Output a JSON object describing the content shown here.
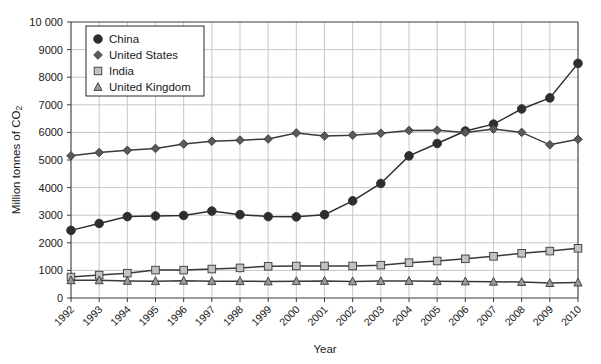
{
  "chart_data": {
    "type": "line",
    "title": "",
    "xlabel": "Year",
    "ylabel": "Million tonnes of CO₂",
    "ylim": [
      0,
      10000
    ],
    "ytick_step": 1000,
    "ytick_labels": [
      "0",
      "1000",
      "2000",
      "3000",
      "4000",
      "5000",
      "6000",
      "7000",
      "8000",
      "9000",
      "10 000"
    ],
    "grid": true,
    "legend_position": "top-left",
    "x": [
      1992,
      1993,
      1994,
      1995,
      1996,
      1997,
      1998,
      1999,
      2000,
      2001,
      2002,
      2003,
      2004,
      2005,
      2006,
      2007,
      2008,
      2009,
      2010
    ],
    "categories": [
      "1992",
      "1993",
      "1994",
      "1995",
      "1996",
      "1997",
      "1998",
      "1999",
      "2000",
      "2001",
      "2002",
      "2003",
      "2004",
      "2005",
      "2006",
      "2007",
      "2008",
      "2009",
      "2010"
    ],
    "series": [
      {
        "name": "China",
        "marker": "circle",
        "color": "#2e2e2e",
        "marker_fill": "#2e2e2e",
        "values": [
          2450,
          2700,
          2950,
          2970,
          2990,
          3150,
          3020,
          2950,
          2940,
          3020,
          3520,
          4150,
          5150,
          5600,
          6050,
          6300,
          6850,
          7250,
          8500
        ]
      },
      {
        "name": "United States",
        "marker": "diamond",
        "color": "#3a3a3a",
        "marker_fill": "#5a5a5a",
        "values": [
          5150,
          5270,
          5350,
          5420,
          5580,
          5680,
          5720,
          5760,
          5980,
          5870,
          5900,
          5970,
          6070,
          6080,
          6000,
          6120,
          6000,
          5550,
          5750
        ]
      },
      {
        "name": "India",
        "marker": "square",
        "color": "#3a3a3a",
        "marker_fill": "#c2c2c2",
        "values": [
          760,
          830,
          900,
          1010,
          1010,
          1050,
          1090,
          1150,
          1160,
          1160,
          1160,
          1190,
          1280,
          1340,
          1420,
          1510,
          1620,
          1700,
          1800
        ]
      },
      {
        "name": "United Kingdom",
        "marker": "triangle",
        "color": "#3a3a3a",
        "marker_fill": "#9a9a9a",
        "values": [
          640,
          640,
          620,
          610,
          625,
          610,
          610,
          600,
          610,
          620,
          600,
          615,
          615,
          610,
          600,
          590,
          580,
          540,
          560
        ]
      }
    ]
  },
  "legend": {
    "items": [
      {
        "label": "China"
      },
      {
        "label": "United States"
      },
      {
        "label": "India"
      },
      {
        "label": "United Kingdom"
      }
    ]
  },
  "axes": {
    "x_title": "Year",
    "y_title_main": "Million tonnes of CO",
    "y_title_sub": "2"
  },
  "colors": {
    "background": "#ffffff",
    "grid": "#b9b9b9",
    "axis": "#3a3a3a",
    "text": "#1a1a1a",
    "china": "#2e2e2e",
    "united_states": "#5a5a5a",
    "india": "#c2c2c2",
    "united_kingdom": "#9a9a9a"
  }
}
